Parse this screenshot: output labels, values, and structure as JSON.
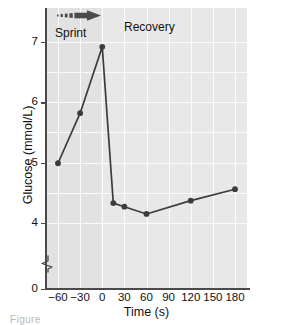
{
  "chart_data": {
    "type": "line",
    "title": "",
    "xlabel": "Time (s)",
    "ylabel": "Glucose (mmol/L)",
    "xlim": [
      -70,
      190
    ],
    "ylim": [
      3.7,
      7.35
    ],
    "y_axis_break": true,
    "y_break_between": [
      0,
      4
    ],
    "grid": true,
    "legend": "none",
    "xticks": [
      "-60",
      "-30",
      "0",
      "30",
      "60",
      "90",
      "120",
      "150",
      "180"
    ],
    "xtick_values": [
      -60,
      -30,
      0,
      30,
      60,
      90,
      120,
      150,
      180
    ],
    "yticks": [
      "0",
      "4",
      "5",
      "6",
      "7"
    ],
    "ytick_values": [
      0,
      4,
      5,
      6,
      7
    ],
    "x": [
      -60,
      -30,
      0,
      15,
      30,
      60,
      120,
      180
    ],
    "values": [
      4.99,
      5.82,
      6.92,
      4.33,
      4.27,
      4.15,
      4.37,
      4.56
    ],
    "series": [
      {
        "name": "Blood glucose",
        "marker": "filled-circle",
        "color": "#3c3c3c",
        "points": [
          {
            "x": -60,
            "y": 4.99
          },
          {
            "x": -30,
            "y": 5.82
          },
          {
            "x": 0,
            "y": 6.92
          },
          {
            "x": 15,
            "y": 4.33
          },
          {
            "x": 30,
            "y": 4.27
          },
          {
            "x": 60,
            "y": 4.15
          },
          {
            "x": 120,
            "y": 4.37
          },
          {
            "x": 180,
            "y": 4.56
          }
        ]
      }
    ],
    "annotations": [
      {
        "name": "sprint-phase",
        "label": "Sprint",
        "x_range": [
          -60,
          0
        ]
      },
      {
        "name": "recovery-phase",
        "label": "Recovery",
        "x_range": [
          0,
          180
        ]
      },
      {
        "name": "sprint-arrow",
        "label": "",
        "style": "dashed-to-solid-right-arrow"
      }
    ],
    "colors": {
      "plot_background": "#e8e8e8",
      "sprint_background": "#e2e2e2",
      "gridline": "#fbfbfb",
      "axis": "#4a4a4a",
      "line": "#3c3c3c",
      "marker": "#2e2e2e",
      "text": "#111111"
    }
  },
  "caption": {
    "text": "Figure"
  }
}
